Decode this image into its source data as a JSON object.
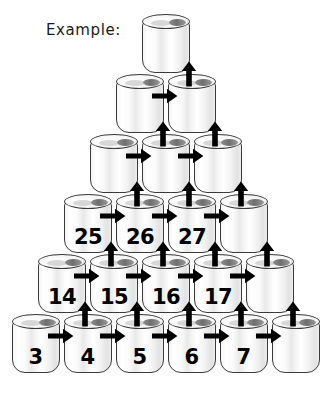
{
  "heading": {
    "text": "Example:"
  },
  "diagram": {
    "type": "can-pyramid",
    "rows": 6,
    "row_counts": [
      1,
      2,
      3,
      4,
      5,
      6
    ],
    "cans": [
      {
        "row": 0,
        "col": 0,
        "label": ""
      },
      {
        "row": 1,
        "col": 0,
        "label": ""
      },
      {
        "row": 1,
        "col": 1,
        "label": ""
      },
      {
        "row": 2,
        "col": 0,
        "label": ""
      },
      {
        "row": 2,
        "col": 1,
        "label": ""
      },
      {
        "row": 2,
        "col": 2,
        "label": ""
      },
      {
        "row": 3,
        "col": 0,
        "label": "25"
      },
      {
        "row": 3,
        "col": 1,
        "label": "26"
      },
      {
        "row": 3,
        "col": 2,
        "label": "27"
      },
      {
        "row": 3,
        "col": 3,
        "label": ""
      },
      {
        "row": 4,
        "col": 0,
        "label": "14"
      },
      {
        "row": 4,
        "col": 1,
        "label": "15"
      },
      {
        "row": 4,
        "col": 2,
        "label": "16"
      },
      {
        "row": 4,
        "col": 3,
        "label": "17"
      },
      {
        "row": 4,
        "col": 4,
        "label": ""
      },
      {
        "row": 5,
        "col": 0,
        "label": "3"
      },
      {
        "row": 5,
        "col": 1,
        "label": "4"
      },
      {
        "row": 5,
        "col": 2,
        "label": "5"
      },
      {
        "row": 5,
        "col": 3,
        "label": "6"
      },
      {
        "row": 5,
        "col": 4,
        "label": "7"
      },
      {
        "row": 5,
        "col": 5,
        "label": ""
      }
    ],
    "arrows": {
      "right_counts": [
        0,
        1,
        2,
        3,
        4,
        5
      ],
      "up_counts": [
        1,
        2,
        3,
        4,
        5,
        0
      ],
      "color": "#000000"
    },
    "colors": {
      "can_outline": "#3a3a3a",
      "can_body": "#f4f4f4",
      "can_hole": "#6f6f6f",
      "number": "#000000",
      "background": "#ffffff"
    }
  }
}
